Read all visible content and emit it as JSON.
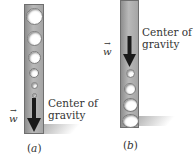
{
  "figure": {
    "panels": [
      {
        "id": "a",
        "caption_open": "(",
        "caption_letter": "a",
        "caption_close": ")",
        "vector_label": "w",
        "cg_label_line1": "Center of",
        "cg_label_line2": "gravity",
        "arrow_position": "bottom",
        "hole_diameters_top_to_bottom": [
          17,
          15,
          13,
          10,
          7,
          5
        ]
      },
      {
        "id": "b",
        "caption_open": "(",
        "caption_letter": "b",
        "caption_close": ")",
        "vector_label": "w",
        "cg_label_line1": "Center of",
        "cg_label_line2": "gravity",
        "arrow_position": "top",
        "hole_diameters_top_to_bottom": [
          9,
          12,
          15,
          17
        ]
      }
    ],
    "colors": {
      "bar": "#a8a8a8",
      "bar_border": "#6f6f6f",
      "arrow": "#1a1a1a",
      "text": "#333333"
    }
  }
}
